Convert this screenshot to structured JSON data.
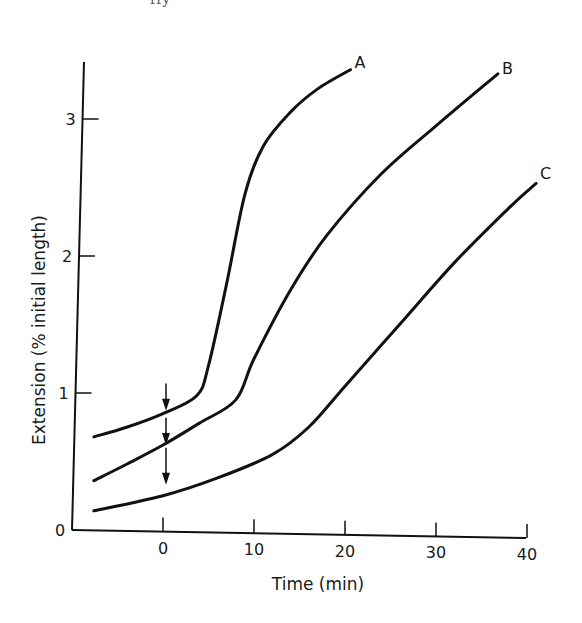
{
  "caption_fragment": "ffy",
  "chart_data": {
    "type": "line",
    "title": "",
    "xlabel": "Time (min)",
    "ylabel": "Extension (% initial length)",
    "xlim": [
      -10,
      41
    ],
    "ylim": [
      0,
      3.5
    ],
    "x_ticks": [
      0,
      10,
      20,
      30,
      40
    ],
    "x_tick_labels": [
      "0",
      "10",
      "20",
      "30",
      "40"
    ],
    "y_ticks": [
      0,
      1,
      2,
      3
    ],
    "y_tick_labels": [
      "0",
      "1",
      "2",
      "3"
    ],
    "grid": false,
    "legend": "none (curves labeled directly at end points)",
    "series": [
      {
        "name": "A",
        "points": [
          [
            -7.6,
            0.68
          ],
          [
            -4,
            0.75
          ],
          [
            0,
            0.85
          ],
          [
            3.7,
            0.98
          ],
          [
            5,
            1.2
          ],
          [
            7,
            1.8
          ],
          [
            9,
            2.45
          ],
          [
            11,
            2.8
          ],
          [
            14,
            3.05
          ],
          [
            17,
            3.22
          ],
          [
            20.6,
            3.36
          ]
        ]
      },
      {
        "name": "B",
        "points": [
          [
            -7.6,
            0.36
          ],
          [
            -4,
            0.48
          ],
          [
            0,
            0.62
          ],
          [
            4,
            0.78
          ],
          [
            8,
            0.95
          ],
          [
            10,
            1.25
          ],
          [
            14,
            1.75
          ],
          [
            18,
            2.15
          ],
          [
            24,
            2.6
          ],
          [
            30,
            2.95
          ],
          [
            36.8,
            3.33
          ]
        ]
      },
      {
        "name": "C",
        "points": [
          [
            -7.6,
            0.14
          ],
          [
            0,
            0.25
          ],
          [
            6,
            0.38
          ],
          [
            12,
            0.55
          ],
          [
            16,
            0.75
          ],
          [
            20,
            1.05
          ],
          [
            26,
            1.5
          ],
          [
            32,
            1.95
          ],
          [
            38,
            2.35
          ],
          [
            41,
            2.53
          ]
        ]
      }
    ],
    "annotations": [
      {
        "type": "arrow",
        "x": 0,
        "from_y": 1.07,
        "to_y": 0.87,
        "note": "downward arrow at t=0 pointing to curve A"
      },
      {
        "type": "arrow",
        "x": 0,
        "from_y": 0.82,
        "to_y": 0.62,
        "note": "downward arrow at t=0 pointing to curve B"
      },
      {
        "type": "arrow",
        "x": 0,
        "from_y": 0.6,
        "to_y": 0.33,
        "note": "downward arrow at t=0 pointing toward curve C"
      }
    ]
  },
  "labels": {
    "xlabel": "Time (min)",
    "ylabel": "Extension (% initial length)",
    "series_A": "A",
    "series_B": "B",
    "series_C": "C"
  },
  "style": {
    "line_color": "#111111",
    "background": "#ffffff"
  }
}
